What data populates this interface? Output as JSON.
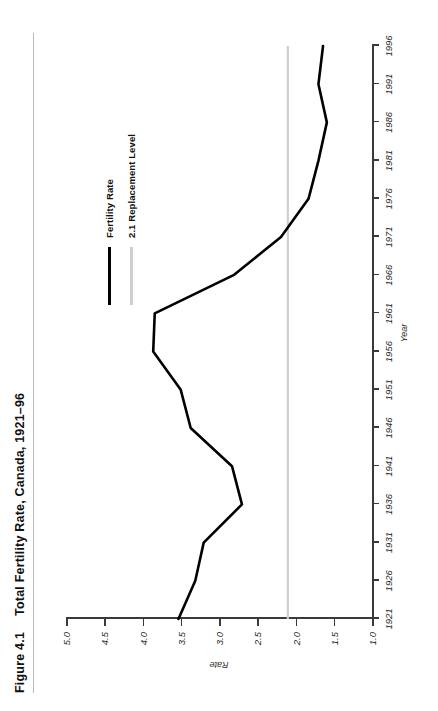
{
  "figure": {
    "number": "Figure 4.1",
    "title": "Total Fertility Rate, Canada, 1921–96"
  },
  "axes": {
    "xlabel": "Year",
    "ylabel": "Rate"
  },
  "legend": {
    "items": [
      {
        "label": "Fertility Rate",
        "color": "#000000"
      },
      {
        "label": "2.1 Replacement Level",
        "color": "#cfcfcf"
      }
    ]
  },
  "chart_data": {
    "type": "line",
    "title": "Total Fertility Rate, Canada, 1921–96",
    "xlabel": "Year",
    "ylabel": "Rate",
    "xlim": [
      1921,
      1996
    ],
    "ylim": [
      1.0,
      5.0
    ],
    "xticks": [
      1921,
      1926,
      1931,
      1936,
      1941,
      1946,
      1951,
      1956,
      1961,
      1966,
      1971,
      1976,
      1981,
      1986,
      1991,
      1996
    ],
    "yticks": [
      1.0,
      1.5,
      2.0,
      2.5,
      3.0,
      3.5,
      4.0,
      4.5,
      5.0
    ],
    "xtick_labels": [
      "1921",
      "1926",
      "1931",
      "1936",
      "1941",
      "1946",
      "1951",
      "1956",
      "1961",
      "1966",
      "1971",
      "1976",
      "1981",
      "1986",
      "1991",
      "1996"
    ],
    "ytick_labels": [
      "1.0",
      "1.5",
      "2.0",
      "2.5",
      "3.0",
      "3.5",
      "4.0",
      "4.5",
      "5.0"
    ],
    "grid": false,
    "legend_position": "upper right",
    "x": [
      1921,
      1926,
      1931,
      1936,
      1941,
      1946,
      1951,
      1956,
      1961,
      1966,
      1971,
      1976,
      1981,
      1986,
      1991,
      1996
    ],
    "series": [
      {
        "name": "Fertility Rate",
        "color": "#000000",
        "values": [
          3.53,
          3.31,
          3.2,
          2.7,
          2.83,
          3.37,
          3.5,
          3.86,
          3.84,
          2.81,
          2.19,
          1.83,
          1.7,
          1.59,
          1.7,
          1.64
        ]
      },
      {
        "name": "2.1 Replacement Level",
        "color": "#cfcfcf",
        "values": [
          2.1,
          2.1,
          2.1,
          2.1,
          2.1,
          2.1,
          2.1,
          2.1,
          2.1,
          2.1,
          2.1,
          2.1,
          2.1,
          2.1,
          2.1,
          2.1
        ]
      }
    ]
  }
}
